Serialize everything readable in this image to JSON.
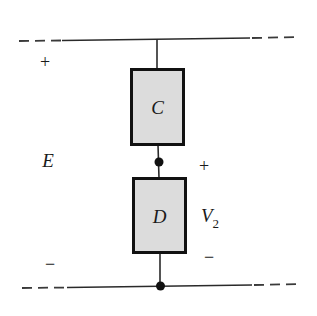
{
  "diagram": {
    "type": "series circuit fragment",
    "colors": {
      "wire": "#2a2a2a",
      "box_fill": "#dcdcdc",
      "box_stroke": "#111111",
      "text": "#1a1a1a"
    },
    "source": {
      "label": "E",
      "plus": "+",
      "minus": "−"
    },
    "components": [
      {
        "id": "C",
        "label": "C"
      },
      {
        "id": "D",
        "label": "D"
      }
    ],
    "voltage": {
      "label": "V",
      "subscript": "2",
      "plus": "+",
      "minus": "−"
    },
    "nodes": [
      {
        "id": "junction-c-d"
      },
      {
        "id": "bottom-rail-node"
      }
    ]
  }
}
